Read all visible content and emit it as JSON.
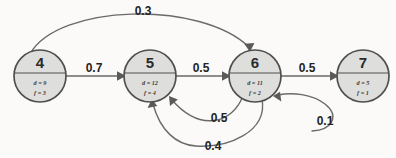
{
  "diagram": {
    "background_color": "#fbfaf8",
    "node_fill": "#dededc",
    "node_stroke": "#4f4f4f",
    "edge_stroke": "#6a6a6a",
    "nodes": [
      {
        "id": "4",
        "d_label": "d = 9",
        "f_label": "f = 3",
        "cx": 40,
        "cy": 76
      },
      {
        "id": "5",
        "d_label": "d = 12",
        "f_label": "f = 4",
        "cx": 150,
        "cy": 76
      },
      {
        "id": "6",
        "d_label": "d = 11",
        "f_label": "f = 2",
        "cx": 255,
        "cy": 76
      },
      {
        "id": "7",
        "d_label": "d = 5",
        "f_label": "f = 1",
        "cx": 363,
        "cy": 76
      }
    ],
    "edges": [
      {
        "from": "4",
        "to": "5",
        "weight": "0.7",
        "shape": "straight"
      },
      {
        "from": "5",
        "to": "6",
        "weight": "0.5",
        "shape": "straight"
      },
      {
        "from": "6",
        "to": "7",
        "weight": "0.5",
        "shape": "straight"
      },
      {
        "from": "4",
        "to": "6",
        "weight": "0.3",
        "shape": "arc-top"
      },
      {
        "from": "6",
        "to": "5",
        "weight": "0.5",
        "shape": "curve-lower-short"
      },
      {
        "from": "6",
        "to": "5",
        "weight": "0.4",
        "shape": "curve-lower-long"
      },
      {
        "from": "7",
        "to": "6",
        "weight": "0.1",
        "shape": "curve-lower-right"
      }
    ]
  }
}
